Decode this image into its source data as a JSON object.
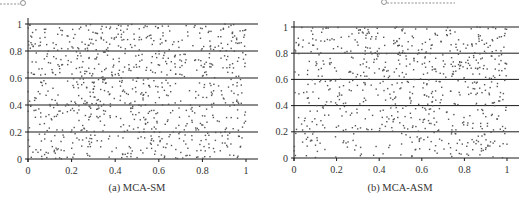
{
  "chart_data": [
    {
      "type": "scatter",
      "caption": "(a) MCA-SM",
      "title": "",
      "xlabel": "",
      "ylabel": "",
      "xlim": [
        0,
        1
      ],
      "ylim": [
        0,
        1
      ],
      "x_ticks": [
        "0",
        "0.2",
        "0.4",
        "0.6",
        "0.8",
        "1"
      ],
      "y_ticks": [
        "0",
        "0.2",
        "0.4",
        "0.6",
        "0.8",
        "1"
      ],
      "grid": "horizontal at y = 0, 0.2, 0.4, 0.6, 0.8, 1",
      "legend": "none",
      "series": [
        {
          "name": "points",
          "distribution": "approximately uniform over [0,1]x[0,1]",
          "approx_count": 900,
          "seed": 17,
          "color": "#555555"
        }
      ]
    },
    {
      "type": "scatter",
      "caption": "(b) MCA-ASM",
      "title": "",
      "xlabel": "",
      "ylabel": "",
      "xlim": [
        0,
        1
      ],
      "ylim": [
        0,
        1
      ],
      "x_ticks": [
        "0",
        "0.2",
        "0.4",
        "0.6",
        "0.8",
        "1"
      ],
      "y_ticks": [
        "0",
        "0.2",
        "0.4",
        "0.6",
        "0.8",
        "1"
      ],
      "grid": "horizontal at y = 0, 0.2, 0.4, 0.6, 0.8, 1",
      "legend": "none",
      "series": [
        {
          "name": "points",
          "distribution": "non-uniform, denser toward upper-right (x>0.5, y>0.5)",
          "approx_count": 750,
          "seed": 91,
          "color": "#555555"
        }
      ]
    }
  ],
  "panels": [
    {
      "caption": "(a) MCA-SM"
    },
    {
      "caption": "(b) MCA-ASM"
    }
  ],
  "ticks": [
    "0",
    "0.2",
    "0.4",
    "0.6",
    "0.8",
    "1"
  ]
}
